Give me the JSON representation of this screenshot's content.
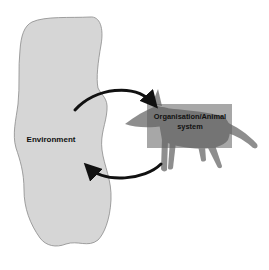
{
  "diagram": {
    "type": "cycle",
    "nodes": [
      {
        "id": "environment",
        "label": "Environment",
        "shape": "irregular-blob",
        "fill": "#d6d6d6"
      },
      {
        "id": "organisation",
        "label": "Organisation/Animal system",
        "label_line1": "Organisation/Animal",
        "label_line2": "system",
        "shape": "rectangle-over-animal-silhouette",
        "fill": "#7c7c7c"
      }
    ],
    "edges": [
      {
        "from": "environment",
        "to": "organisation",
        "style": "curved-arrow-top"
      },
      {
        "from": "organisation",
        "to": "environment",
        "style": "curved-arrow-bottom"
      }
    ],
    "colors": {
      "blob_fill": "#d6d6d6",
      "blob_stroke": "#8a8a8a",
      "animal_fill": "#8e8e8e",
      "box_fill": "#6f6f6f",
      "arrow": "#111111",
      "text": "#111111"
    }
  }
}
